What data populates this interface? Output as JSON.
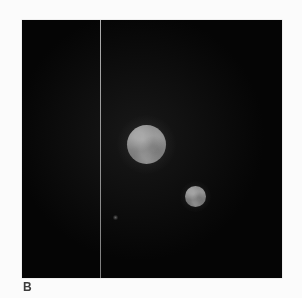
{
  "figure": {
    "panel_label": "B",
    "background_color": "#fbfbfb",
    "panel_background_color": "#050505",
    "panel_border_color": "#e2e2e2"
  },
  "chart_data": {
    "type": "scatter",
    "title": "",
    "subtitle": "",
    "xlabel": "",
    "ylabel": "",
    "panel_label": "B",
    "grid": false,
    "legend": false,
    "axis_ticks": false,
    "panel_bounds_px": {
      "x": 22,
      "y": 20,
      "width": 260,
      "height": 258
    },
    "xlim": [
      0,
      260
    ],
    "ylim": [
      0,
      258
    ],
    "annotations": [
      {
        "name": "slit-line",
        "kind": "vertical-line",
        "x": 78,
        "color": "#d7d7d7",
        "width_px": 1,
        "label": ""
      }
    ],
    "series": [
      {
        "name": "sources",
        "points": [
          {
            "id": "primary",
            "label": "",
            "x": 124.5,
            "y": 124.5,
            "radius_px": 19.5,
            "brightness": "#8f8f8f"
          },
          {
            "id": "secondary",
            "label": "",
            "x": 173.5,
            "y": 176.5,
            "radius_px": 10.5,
            "brightness": "#888888"
          },
          {
            "id": "faint",
            "label": "",
            "x": 93.5,
            "y": 197.5,
            "radius_px": 2.5,
            "brightness": "#5a5a5a"
          }
        ]
      }
    ]
  }
}
